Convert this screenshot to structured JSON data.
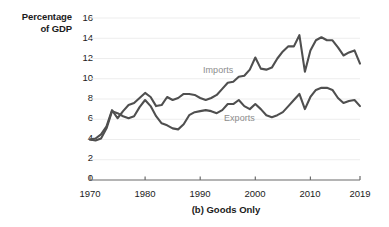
{
  "axes": {
    "ylabel_line1": "Percentage",
    "ylabel_line2": "of GDP",
    "caption": "(b) Goods Only",
    "yticks": [
      "16",
      "14",
      "12",
      "10",
      "8",
      "6",
      "4",
      "2",
      "0"
    ],
    "xticks": [
      "1970",
      "1980",
      "1990",
      "2000",
      "2010",
      "2019"
    ]
  },
  "series_labels": {
    "imports": "Imports",
    "exports": "Exports"
  },
  "colors": {
    "line": "#4f4f4f",
    "axis": "#6b6b6b",
    "grid": "#ededed",
    "label_text": "#8c8c8c",
    "tick_text": "#1b1b1b",
    "background": "#ffffff"
  },
  "chart_data": {
    "type": "line",
    "title": "(b) Goods Only",
    "xlabel": "",
    "ylabel": "Percentage of GDP",
    "xlim": [
      1970,
      2019
    ],
    "ylim": [
      0,
      16
    ],
    "ytick_values": [
      0,
      2,
      4,
      6,
      8,
      10,
      12,
      14,
      16
    ],
    "xtick_values": [
      1970,
      1980,
      1990,
      2000,
      2010,
      2019
    ],
    "grid": "horizontal",
    "legend": "inline-annotations",
    "x": [
      1970,
      1971,
      1972,
      1973,
      1974,
      1975,
      1976,
      1977,
      1978,
      1979,
      1980,
      1981,
      1982,
      1983,
      1984,
      1985,
      1986,
      1987,
      1988,
      1989,
      1990,
      1991,
      1992,
      1993,
      1994,
      1995,
      1996,
      1997,
      1998,
      1999,
      2000,
      2001,
      2002,
      2003,
      2004,
      2005,
      2006,
      2007,
      2008,
      2009,
      2010,
      2011,
      2012,
      2013,
      2014,
      2015,
      2016,
      2017,
      2018,
      2019
    ],
    "series": [
      {
        "name": "Imports",
        "values": [
          4.0,
          4.1,
          4.5,
          5.3,
          6.9,
          6.1,
          6.8,
          7.4,
          7.6,
          8.1,
          8.6,
          8.2,
          7.3,
          7.4,
          8.2,
          7.9,
          8.1,
          8.5,
          8.5,
          8.4,
          8.1,
          7.9,
          8.1,
          8.4,
          9.0,
          9.6,
          9.7,
          10.2,
          10.3,
          10.9,
          12.1,
          11.0,
          10.9,
          11.1,
          12.0,
          12.7,
          13.2,
          13.2,
          14.3,
          10.7,
          12.8,
          13.8,
          14.1,
          13.8,
          13.8,
          13.1,
          12.3,
          12.6,
          12.8,
          11.5
        ]
      },
      {
        "name": "Exports",
        "values": [
          4.0,
          3.9,
          4.1,
          5.1,
          6.8,
          6.6,
          6.3,
          6.1,
          6.3,
          7.2,
          7.9,
          7.3,
          6.3,
          5.6,
          5.4,
          5.1,
          5.0,
          5.5,
          6.4,
          6.7,
          6.8,
          6.9,
          6.8,
          6.6,
          6.9,
          7.5,
          7.5,
          7.9,
          7.3,
          7.0,
          7.5,
          7.0,
          6.4,
          6.2,
          6.4,
          6.7,
          7.3,
          7.9,
          8.5,
          7.0,
          8.2,
          8.9,
          9.1,
          9.1,
          8.9,
          8.1,
          7.6,
          7.8,
          7.9,
          7.3
        ]
      }
    ]
  }
}
